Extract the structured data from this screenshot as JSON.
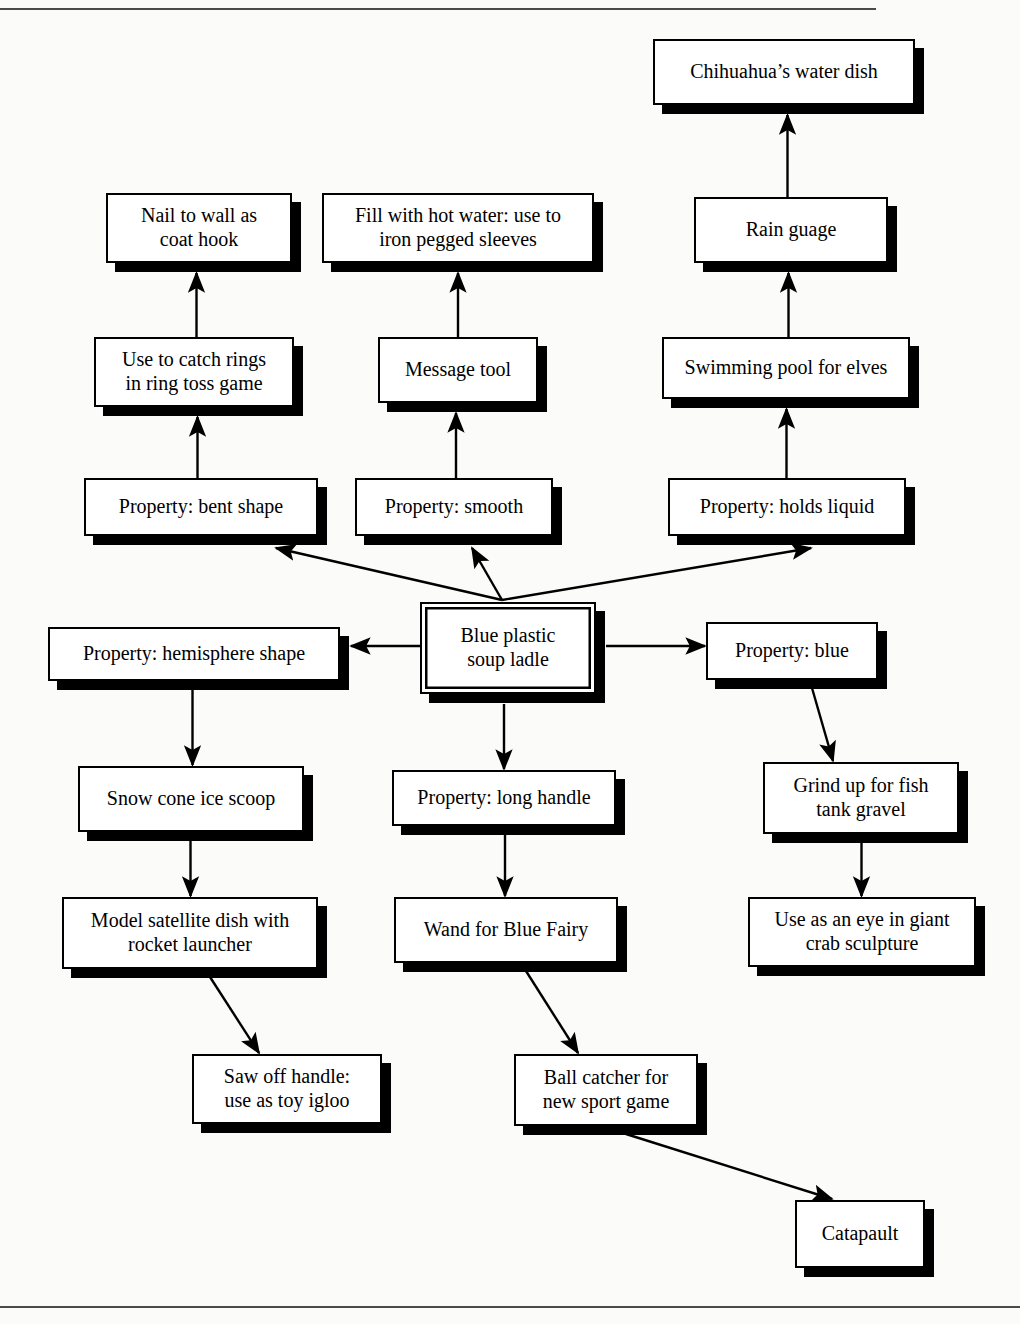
{
  "diagram": {
    "type": "concept-map",
    "title_rules": {
      "top_rule": "horizontal-rule",
      "bottom_rule": "horizontal-rule"
    },
    "root": "Blue plastic soup ladle",
    "nodes": [
      {
        "id": "ladle",
        "label": "Blue plastic\nsoup ladle",
        "x": 420,
        "y": 602,
        "w": 176,
        "h": 92,
        "kind": "root"
      },
      {
        "id": "bent",
        "label": "Property: bent shape",
        "x": 84,
        "y": 478,
        "w": 234,
        "h": 58,
        "kind": "property"
      },
      {
        "id": "smooth",
        "label": "Property: smooth",
        "x": 355,
        "y": 478,
        "w": 198,
        "h": 58,
        "kind": "property"
      },
      {
        "id": "holds",
        "label": "Property: holds liquid",
        "x": 668,
        "y": 478,
        "w": 238,
        "h": 58,
        "kind": "property"
      },
      {
        "id": "hemisphere",
        "label": "Property: hemisphere shape",
        "x": 48,
        "y": 627,
        "w": 292,
        "h": 54,
        "kind": "property"
      },
      {
        "id": "blue",
        "label": "Property: blue",
        "x": 706,
        "y": 622,
        "w": 172,
        "h": 58,
        "kind": "property"
      },
      {
        "id": "longhandle",
        "label": "Property: long handle",
        "x": 392,
        "y": 770,
        "w": 224,
        "h": 56,
        "kind": "property"
      },
      {
        "id": "ringtoss",
        "label": "Use to catch rings\nin ring toss game",
        "x": 94,
        "y": 337,
        "w": 200,
        "h": 70,
        "kind": "use"
      },
      {
        "id": "coathook",
        "label": "Nail to wall as\ncoat hook",
        "x": 106,
        "y": 193,
        "w": 186,
        "h": 70,
        "kind": "use"
      },
      {
        "id": "messagetool",
        "label": "Message tool",
        "x": 378,
        "y": 337,
        "w": 160,
        "h": 66,
        "kind": "use"
      },
      {
        "id": "hotwater",
        "label": "Fill with hot water: use to\niron pegged sleeves",
        "x": 322,
        "y": 193,
        "w": 272,
        "h": 70,
        "kind": "use"
      },
      {
        "id": "swimpool",
        "label": "Swimming pool for elves",
        "x": 662,
        "y": 337,
        "w": 248,
        "h": 62,
        "kind": "use"
      },
      {
        "id": "rainguage",
        "label": "Rain guage",
        "x": 694,
        "y": 197,
        "w": 194,
        "h": 66,
        "kind": "use"
      },
      {
        "id": "waterdish",
        "label": "Chihuahua’s water dish",
        "x": 653,
        "y": 39,
        "w": 262,
        "h": 66,
        "kind": "use"
      },
      {
        "id": "snowcone",
        "label": "Snow cone ice scoop",
        "x": 78,
        "y": 766,
        "w": 226,
        "h": 66,
        "kind": "use"
      },
      {
        "id": "satellite",
        "label": "Model satellite dish with\nrocket launcher",
        "x": 62,
        "y": 897,
        "w": 256,
        "h": 72,
        "kind": "use"
      },
      {
        "id": "igloo",
        "label": "Saw off handle:\nuse as toy igloo",
        "x": 192,
        "y": 1054,
        "w": 190,
        "h": 70,
        "kind": "use"
      },
      {
        "id": "wand",
        "label": "Wand for Blue Fairy",
        "x": 394,
        "y": 897,
        "w": 224,
        "h": 66,
        "kind": "use"
      },
      {
        "id": "ballcatcher",
        "label": "Ball catcher for\nnew sport game",
        "x": 514,
        "y": 1054,
        "w": 184,
        "h": 72,
        "kind": "use"
      },
      {
        "id": "catapault",
        "label": "Catapault",
        "x": 795,
        "y": 1200,
        "w": 130,
        "h": 68,
        "kind": "use"
      },
      {
        "id": "grindup",
        "label": "Grind up for fish\ntank gravel",
        "x": 763,
        "y": 762,
        "w": 196,
        "h": 72,
        "kind": "use"
      },
      {
        "id": "crabeye",
        "label": "Use as an eye in giant\ncrab sculpture",
        "x": 748,
        "y": 897,
        "w": 228,
        "h": 70,
        "kind": "use"
      }
    ],
    "edges": [
      {
        "from": "ladle",
        "to": "bent",
        "style": "diagonal"
      },
      {
        "from": "ladle",
        "to": "smooth",
        "style": "diagonal"
      },
      {
        "from": "ladle",
        "to": "holds",
        "style": "diagonal"
      },
      {
        "from": "ladle",
        "to": "hemisphere",
        "style": "horizontal"
      },
      {
        "from": "ladle",
        "to": "blue",
        "style": "horizontal"
      },
      {
        "from": "ladle",
        "to": "longhandle",
        "style": "vertical"
      },
      {
        "from": "bent",
        "to": "ringtoss",
        "style": "vertical"
      },
      {
        "from": "ringtoss",
        "to": "coathook",
        "style": "vertical"
      },
      {
        "from": "smooth",
        "to": "messagetool",
        "style": "vertical"
      },
      {
        "from": "messagetool",
        "to": "hotwater",
        "style": "vertical"
      },
      {
        "from": "holds",
        "to": "swimpool",
        "style": "vertical"
      },
      {
        "from": "swimpool",
        "to": "rainguage",
        "style": "vertical"
      },
      {
        "from": "rainguage",
        "to": "waterdish",
        "style": "vertical"
      },
      {
        "from": "hemisphere",
        "to": "snowcone",
        "style": "vertical"
      },
      {
        "from": "snowcone",
        "to": "satellite",
        "style": "vertical"
      },
      {
        "from": "satellite",
        "to": "igloo",
        "style": "diagonal"
      },
      {
        "from": "longhandle",
        "to": "wand",
        "style": "vertical"
      },
      {
        "from": "wand",
        "to": "ballcatcher",
        "style": "diagonal"
      },
      {
        "from": "ballcatcher",
        "to": "catapault",
        "style": "diagonal"
      },
      {
        "from": "blue",
        "to": "grindup",
        "style": "diagonal"
      },
      {
        "from": "grindup",
        "to": "crabeye",
        "style": "vertical"
      }
    ],
    "colors": {
      "ink": "#000000",
      "paper": "#fbfbfa",
      "rule": "#4a4a4a"
    }
  }
}
